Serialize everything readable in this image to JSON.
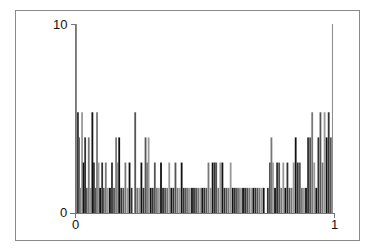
{
  "chart_data": {
    "type": "bar",
    "title": "",
    "xlabel": "",
    "ylabel": "",
    "xlim": [
      0,
      1
    ],
    "ylim": [
      0,
      10
    ],
    "x_ticks": [
      "0",
      "1"
    ],
    "y_ticks": [
      "0",
      "10"
    ],
    "grid": false,
    "legend": null,
    "bar_levels": [
      1.33,
      2.67,
      4.0,
      5.33,
      10
    ],
    "bars": [
      {
        "x": 0.0,
        "h": 10
      },
      {
        "x": 0.004,
        "h": 5.33
      },
      {
        "x": 0.008,
        "h": 4.0
      },
      {
        "x": 0.012,
        "h": 1.33
      },
      {
        "x": 0.02,
        "h": 5.33
      },
      {
        "x": 0.026,
        "h": 2.67
      },
      {
        "x": 0.032,
        "h": 4.0
      },
      {
        "x": 0.038,
        "h": 1.33
      },
      {
        "x": 0.046,
        "h": 4.0
      },
      {
        "x": 0.052,
        "h": 1.33
      },
      {
        "x": 0.06,
        "h": 5.33
      },
      {
        "x": 0.066,
        "h": 2.67
      },
      {
        "x": 0.072,
        "h": 1.33
      },
      {
        "x": 0.078,
        "h": 5.33
      },
      {
        "x": 0.084,
        "h": 2.67
      },
      {
        "x": 0.09,
        "h": 1.33
      },
      {
        "x": 0.098,
        "h": 2.67
      },
      {
        "x": 0.104,
        "h": 1.33
      },
      {
        "x": 0.112,
        "h": 2.67
      },
      {
        "x": 0.12,
        "h": 1.33
      },
      {
        "x": 0.128,
        "h": 1.33
      },
      {
        "x": 0.136,
        "h": 2.67
      },
      {
        "x": 0.144,
        "h": 1.33
      },
      {
        "x": 0.152,
        "h": 4.0
      },
      {
        "x": 0.158,
        "h": 2.67
      },
      {
        "x": 0.164,
        "h": 4.0
      },
      {
        "x": 0.172,
        "h": 1.33
      },
      {
        "x": 0.18,
        "h": 1.33
      },
      {
        "x": 0.188,
        "h": 2.67
      },
      {
        "x": 0.196,
        "h": 1.33
      },
      {
        "x": 0.204,
        "h": 2.67
      },
      {
        "x": 0.212,
        "h": 1.33
      },
      {
        "x": 0.226,
        "h": 5.33
      },
      {
        "x": 0.234,
        "h": 1.33
      },
      {
        "x": 0.242,
        "h": 1.33
      },
      {
        "x": 0.25,
        "h": 2.67
      },
      {
        "x": 0.258,
        "h": 1.33
      },
      {
        "x": 0.266,
        "h": 4.0
      },
      {
        "x": 0.272,
        "h": 2.67
      },
      {
        "x": 0.278,
        "h": 4.0
      },
      {
        "x": 0.286,
        "h": 1.33
      },
      {
        "x": 0.294,
        "h": 1.33
      },
      {
        "x": 0.302,
        "h": 2.67
      },
      {
        "x": 0.31,
        "h": 1.33
      },
      {
        "x": 0.318,
        "h": 1.33
      },
      {
        "x": 0.326,
        "h": 2.67
      },
      {
        "x": 0.334,
        "h": 1.33
      },
      {
        "x": 0.342,
        "h": 1.33
      },
      {
        "x": 0.35,
        "h": 1.33
      },
      {
        "x": 0.358,
        "h": 2.67
      },
      {
        "x": 0.366,
        "h": 1.33
      },
      {
        "x": 0.374,
        "h": 1.33
      },
      {
        "x": 0.382,
        "h": 2.67
      },
      {
        "x": 0.39,
        "h": 1.33
      },
      {
        "x": 0.398,
        "h": 1.33
      },
      {
        "x": 0.406,
        "h": 2.67
      },
      {
        "x": 0.414,
        "h": 1.33
      },
      {
        "x": 0.422,
        "h": 1.33
      },
      {
        "x": 0.43,
        "h": 1.33
      },
      {
        "x": 0.438,
        "h": 1.33
      },
      {
        "x": 0.446,
        "h": 1.33
      },
      {
        "x": 0.454,
        "h": 1.33
      },
      {
        "x": 0.462,
        "h": 1.33
      },
      {
        "x": 0.47,
        "h": 1.33
      },
      {
        "x": 0.478,
        "h": 1.33
      },
      {
        "x": 0.486,
        "h": 1.33
      },
      {
        "x": 0.494,
        "h": 1.33
      },
      {
        "x": 0.502,
        "h": 1.33
      },
      {
        "x": 0.51,
        "h": 2.67
      },
      {
        "x": 0.518,
        "h": 1.33
      },
      {
        "x": 0.526,
        "h": 2.67
      },
      {
        "x": 0.534,
        "h": 2.67
      },
      {
        "x": 0.54,
        "h": 2.67
      },
      {
        "x": 0.548,
        "h": 1.33
      },
      {
        "x": 0.556,
        "h": 2.67
      },
      {
        "x": 0.564,
        "h": 2.67
      },
      {
        "x": 0.572,
        "h": 1.33
      },
      {
        "x": 0.58,
        "h": 1.33
      },
      {
        "x": 0.588,
        "h": 1.33
      },
      {
        "x": 0.596,
        "h": 2.67
      },
      {
        "x": 0.604,
        "h": 1.33
      },
      {
        "x": 0.612,
        "h": 1.33
      },
      {
        "x": 0.62,
        "h": 1.33
      },
      {
        "x": 0.628,
        "h": 1.33
      },
      {
        "x": 0.636,
        "h": 1.33
      },
      {
        "x": 0.644,
        "h": 1.33
      },
      {
        "x": 0.652,
        "h": 1.33
      },
      {
        "x": 0.66,
        "h": 1.33
      },
      {
        "x": 0.668,
        "h": 1.33
      },
      {
        "x": 0.676,
        "h": 1.33
      },
      {
        "x": 0.684,
        "h": 1.33
      },
      {
        "x": 0.692,
        "h": 1.33
      },
      {
        "x": 0.7,
        "h": 1.33
      },
      {
        "x": 0.708,
        "h": 1.33
      },
      {
        "x": 0.716,
        "h": 1.33
      },
      {
        "x": 0.724,
        "h": 1.33
      },
      {
        "x": 0.74,
        "h": 1.33
      },
      {
        "x": 0.748,
        "h": 2.67
      },
      {
        "x": 0.754,
        "h": 4.0
      },
      {
        "x": 0.76,
        "h": 2.67
      },
      {
        "x": 0.768,
        "h": 1.33
      },
      {
        "x": 0.776,
        "h": 2.67
      },
      {
        "x": 0.784,
        "h": 2.67
      },
      {
        "x": 0.792,
        "h": 1.33
      },
      {
        "x": 0.8,
        "h": 2.67
      },
      {
        "x": 0.808,
        "h": 1.33
      },
      {
        "x": 0.816,
        "h": 2.67
      },
      {
        "x": 0.824,
        "h": 1.33
      },
      {
        "x": 0.832,
        "h": 1.33
      },
      {
        "x": 0.84,
        "h": 2.67
      },
      {
        "x": 0.848,
        "h": 4.0
      },
      {
        "x": 0.856,
        "h": 2.67
      },
      {
        "x": 0.864,
        "h": 2.67
      },
      {
        "x": 0.872,
        "h": 1.33
      },
      {
        "x": 0.88,
        "h": 1.33
      },
      {
        "x": 0.888,
        "h": 1.33
      },
      {
        "x": 0.896,
        "h": 4.0
      },
      {
        "x": 0.904,
        "h": 4.0
      },
      {
        "x": 0.912,
        "h": 5.33
      },
      {
        "x": 0.92,
        "h": 2.67
      },
      {
        "x": 0.928,
        "h": 1.33
      },
      {
        "x": 0.936,
        "h": 4.0
      },
      {
        "x": 0.944,
        "h": 5.33
      },
      {
        "x": 0.952,
        "h": 2.67
      },
      {
        "x": 0.96,
        "h": 5.33
      },
      {
        "x": 0.968,
        "h": 4.0
      },
      {
        "x": 0.976,
        "h": 5.33
      },
      {
        "x": 0.984,
        "h": 4.0
      },
      {
        "x": 0.992,
        "h": 10
      }
    ]
  },
  "axes": {
    "y_top_label": "10",
    "y_bottom_label": "0",
    "x_left_label": "0",
    "x_right_label": "1"
  }
}
